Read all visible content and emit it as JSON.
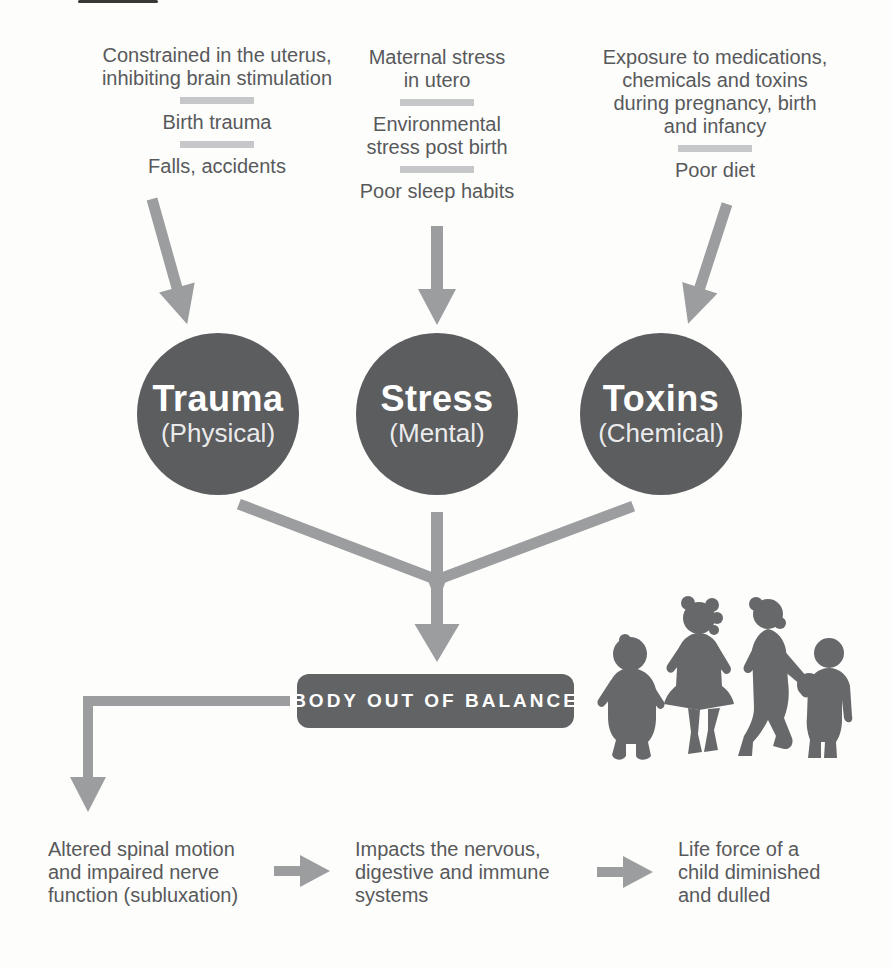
{
  "palette": {
    "background": "#fdfdfc",
    "text": "#58595b",
    "arrow": "#9b9d9f",
    "divider": "#c6c7c9",
    "circle_fill": "#5c5d5f",
    "circle_text": "#ffffff",
    "banner_fill": "#626365",
    "banner_text": "#ffffff",
    "silhouette": "#67686a"
  },
  "cause_columns": [
    {
      "id": "trauma",
      "items": [
        {
          "lines": [
            "Constrained in the uterus,",
            "inhibiting brain stimulation"
          ]
        },
        {
          "lines": [
            "Birth trauma"
          ]
        },
        {
          "lines": [
            "Falls, accidents"
          ]
        }
      ]
    },
    {
      "id": "stress",
      "items": [
        {
          "lines": [
            "Maternal stress",
            "in utero"
          ]
        },
        {
          "lines": [
            "Environmental",
            "stress post birth"
          ]
        },
        {
          "lines": [
            "Poor sleep habits"
          ]
        }
      ]
    },
    {
      "id": "toxins",
      "items": [
        {
          "lines": [
            "Exposure to medications,",
            "chemicals and toxins",
            "during pregnancy, birth",
            "and infancy"
          ]
        },
        {
          "lines": [
            "Poor diet"
          ]
        }
      ]
    }
  ],
  "circles": [
    {
      "title": "Trauma",
      "subtitle": "(Physical)"
    },
    {
      "title": "Stress",
      "subtitle": "(Mental)"
    },
    {
      "title": "Toxins",
      "subtitle": "(Chemical)"
    }
  ],
  "banner": {
    "label": "BODY OUT OF BALANCE"
  },
  "outcomes": [
    {
      "lines": [
        "Altered spinal motion",
        "and impaired nerve",
        "function (subluxation)"
      ]
    },
    {
      "lines": [
        "Impacts the nervous,",
        "digestive and immune",
        "systems"
      ]
    },
    {
      "lines": [
        "Life force of a",
        "child diminished",
        "and dulled"
      ]
    }
  ],
  "illustration": {
    "name": "four-children-silhouettes"
  }
}
